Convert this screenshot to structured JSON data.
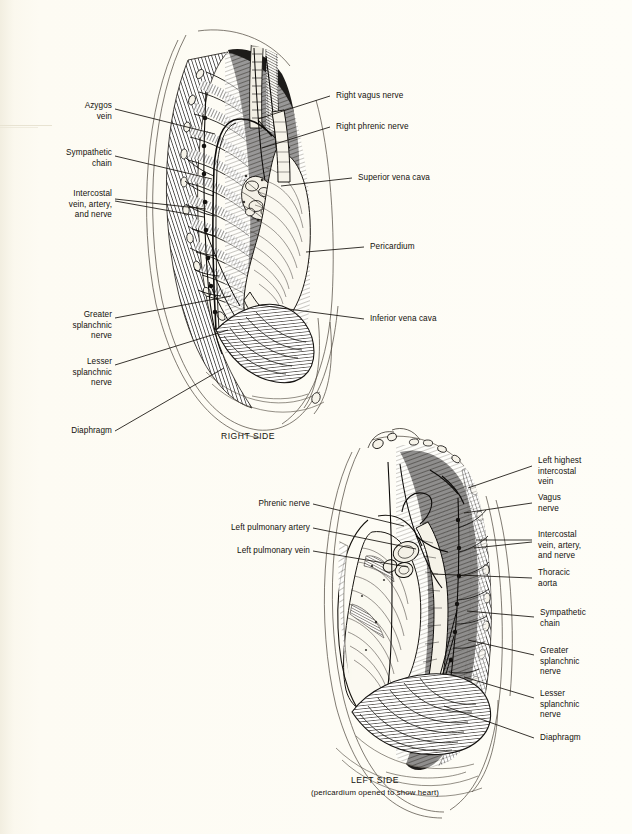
{
  "page": {
    "background_color": "#fdfbf2",
    "ink_color": "#14110c"
  },
  "figures": [
    {
      "id": "right-side",
      "caption": "RIGHT SIDE",
      "subcaption": "",
      "labels_left": [
        {
          "id": "azygos-vein",
          "text": "Azygos\nvein",
          "x": 62,
          "y": 101,
          "w": 50,
          "leader": [
            [
              115,
              109
            ],
            [
              215,
              134
            ]
          ]
        },
        {
          "id": "sympathetic-chain",
          "text": "Sympathetic\nchain",
          "x": 30,
          "y": 148,
          "w": 82,
          "leader": [
            [
              115,
              156
            ],
            [
              212,
              179
            ]
          ]
        },
        {
          "id": "intercostal-van",
          "text": "Intercostal\nvein, artery,\nand nerve",
          "x": 30,
          "y": 189,
          "w": 82,
          "leader": [
            [
              115,
              199
            ],
            [
              205,
              212
            ]
          ]
        },
        {
          "id": "greater-splanchnic-nerve",
          "text": "Greater\nsplanchnic\nnerve",
          "x": 56,
          "y": 310,
          "w": 56,
          "leader": [
            [
              115,
              318
            ],
            [
              231,
              298
            ]
          ]
        },
        {
          "id": "lesser-splanchnic-nerve",
          "text": "Lesser\nsplanchnic\nnerve",
          "x": 56,
          "y": 357,
          "w": 56,
          "leader": [
            [
              115,
              365
            ],
            [
              228,
              331
            ]
          ]
        },
        {
          "id": "diaphragm",
          "text": "Diaphragm",
          "x": 52,
          "y": 426,
          "w": 60,
          "leader": [
            [
              115,
              431
            ],
            [
              222,
              370
            ]
          ]
        }
      ],
      "labels_right": [
        {
          "id": "right-vagus-nerve",
          "text": "Right vagus nerve",
          "x": 336,
          "y": 92,
          "leader": [
            [
              330,
              96
            ],
            [
              258,
              119
            ]
          ]
        },
        {
          "id": "right-phrenic-nerve",
          "text": "Right phrenic nerve",
          "x": 336,
          "y": 123,
          "leader": [
            [
              330,
              127
            ],
            [
              262,
              146
            ]
          ]
        },
        {
          "id": "superior-vena-cava",
          "text": "Superior vena cava",
          "x": 358,
          "y": 174,
          "leader": [
            [
              352,
              178
            ],
            [
              280,
              186
            ]
          ]
        },
        {
          "id": "pericardium",
          "text": "Pericardium",
          "x": 370,
          "y": 243,
          "leader": [
            [
              364,
              247
            ],
            [
              305,
              252
            ]
          ]
        },
        {
          "id": "inferior-vena-cava",
          "text": "Inferior vena cava",
          "x": 370,
          "y": 315,
          "leader": [
            [
              364,
              319
            ],
            [
              258,
              305
            ]
          ]
        }
      ]
    },
    {
      "id": "left-side",
      "caption": "LEFT SIDE",
      "subcaption": "(pericardium opened to show heart)",
      "labels_left": [
        {
          "id": "phrenic-nerve",
          "text": "Phrenic nerve",
          "x": 231,
          "y": 500,
          "w": 79,
          "leader": [
            [
              313,
              504
            ],
            [
              403,
              525
            ]
          ]
        },
        {
          "id": "left-pulmonary-artery",
          "text": "Left pulmonary artery",
          "x": 195,
          "y": 524,
          "w": 115,
          "leader": [
            [
              313,
              528
            ],
            [
              415,
              548
            ]
          ]
        },
        {
          "id": "left-pulmonary-vein",
          "text": "Left pulmonary vein",
          "x": 202,
          "y": 547,
          "w": 108,
          "leader": [
            [
              313,
              551
            ],
            [
              408,
              567
            ]
          ]
        }
      ],
      "labels_right": [
        {
          "id": "left-highest-intercostal-vein",
          "text": "Left highest\nintercostal\nvein",
          "x": 538,
          "y": 461,
          "leader": [
            [
              532,
              466
            ],
            [
              470,
              489
            ]
          ]
        },
        {
          "id": "vagus-nerve",
          "text": "Vagus\nnerve",
          "x": 538,
          "y": 498,
          "leader": [
            [
              532,
              503
            ],
            [
              466,
              514
            ]
          ]
        },
        {
          "id": "intercostal-van-2",
          "text": "Intercostal\nvein, artery,\nand nerve",
          "x": 538,
          "y": 535,
          "leader": [
            [
              532,
              540
            ],
            [
              474,
              544
            ]
          ]
        },
        {
          "id": "thoracic-aorta",
          "text": "Thoracic\naorta",
          "x": 538,
          "y": 573,
          "leader": [
            [
              532,
              578
            ],
            [
              432,
              575
            ]
          ]
        },
        {
          "id": "sympathetic-chain-2",
          "text": "Sympathetic\nchain",
          "x": 540,
          "y": 613,
          "leader": [
            [
              534,
              617
            ],
            [
              467,
              612
            ]
          ]
        },
        {
          "id": "greater-splanchnic-nerve-2",
          "text": "Greater\nsplanchnic\nnerve",
          "x": 540,
          "y": 651,
          "leader": [
            [
              534,
              655
            ],
            [
              468,
              641
            ]
          ]
        },
        {
          "id": "lesser-splanchnic-nerve-2",
          "text": "Lesser\nsplanchnic\nnerve",
          "x": 540,
          "y": 694,
          "leader": [
            [
              534,
              698
            ],
            [
              464,
              678
            ]
          ]
        },
        {
          "id": "diaphragm-2",
          "text": "Diaphragm",
          "x": 540,
          "y": 734,
          "leader": [
            [
              534,
              738
            ],
            [
              443,
              707
            ]
          ]
        }
      ]
    }
  ],
  "captions": {
    "right_side": {
      "text": "RIGHT SIDE",
      "x": 248,
      "y": 436
    },
    "left_side": {
      "text": "LEFT SIDE",
      "x": 375,
      "y": 780
    },
    "left_side_sub": {
      "text": "(pericardium opened to show heart)",
      "x": 375,
      "y": 791
    }
  }
}
